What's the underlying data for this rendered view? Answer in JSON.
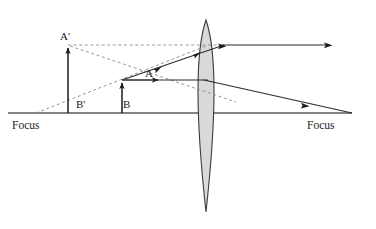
{
  "figure": {
    "type": "optics-ray-diagram",
    "background_color": "#ffffff"
  },
  "colors": {
    "axis": "#5a5a5a",
    "ray_solid": "#2b2b2b",
    "ray_dashed": "#8c8c8c",
    "lens_fill": "#d9d9d9",
    "lens_stroke": "#3a3a3a",
    "object_stroke": "#1a1a1a",
    "text": "#1a1a1a"
  },
  "labels": {
    "image_point": "A'",
    "image_base": "B'",
    "object_point": "A",
    "object_base": "B",
    "focus_left": "Focus",
    "focus_right": "Focus"
  },
  "geometry": {
    "axis": {
      "x1": 8,
      "y": 113,
      "x2": 352
    },
    "lens": {
      "center_x": 206,
      "top_y": 20,
      "bottom_y": 212,
      "half_width": 16
    },
    "focus_left_point": {
      "x": 36,
      "y": 113
    },
    "focus_right_point": {
      "x": 325,
      "y": 113
    },
    "object": {
      "x": 122,
      "base_y": 113,
      "tip_y": 80
    },
    "image": {
      "x": 68,
      "base_y": 113,
      "tip_y": 45
    }
  },
  "rays": [
    {
      "name": "parallel-ray-from-object-tip",
      "style": "solid",
      "points": [
        [
          122,
          80
        ],
        [
          206,
          80
        ]
      ],
      "note": "horizontal ray from A to lens"
    },
    {
      "name": "refracted-ray-to-right-focus",
      "style": "solid",
      "points": [
        [
          206,
          80
        ],
        [
          352,
          113
        ]
      ],
      "note": "exits lens and descends through right focus"
    },
    {
      "name": "ray-through-left-focus",
      "style": "solid",
      "points": [
        [
          122,
          80
        ],
        [
          222,
          45
        ]
      ],
      "note": "ray from object tip rising to lens"
    },
    {
      "name": "refracted-parallel-exit-ray",
      "style": "solid",
      "points": [
        [
          222,
          45
        ],
        [
          332,
          45
        ]
      ],
      "note": "exits lens parallel to axis toward the right"
    },
    {
      "name": "virtual-ray-extension-horizontal",
      "style": "dashed",
      "points": [
        [
          68,
          45
        ],
        [
          222,
          45
        ]
      ],
      "note": "back-extension of the exiting parallel ray to image tip"
    },
    {
      "name": "virtual-ray-extension-oblique",
      "style": "dashed",
      "points": [
        [
          68,
          45
        ],
        [
          232,
          100
        ]
      ],
      "note": "back-extension of the focus ray through the lens"
    },
    {
      "name": "focus-ray-from-left-focus",
      "style": "dashed",
      "points": [
        [
          36,
          113
        ],
        [
          206,
          46
        ]
      ],
      "note": "construction ray originating at left focus"
    }
  ]
}
